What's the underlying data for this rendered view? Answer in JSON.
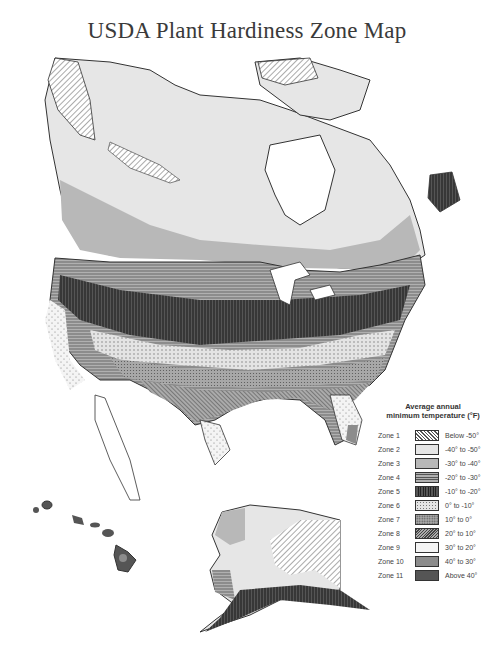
{
  "title": "USDA Plant Hardiness Zone Map",
  "legend": {
    "title_line1": "Average annual",
    "title_line2": "minimum temperature (°F)",
    "zones": [
      {
        "label": "Zone 1",
        "range": "Below -50°",
        "pattern": "diag-hatch",
        "color": "#ffffff"
      },
      {
        "label": "Zone 2",
        "range": "-40° to -50°",
        "pattern": "solid",
        "color": "#e6e6e6"
      },
      {
        "label": "Zone 3",
        "range": "-30° to -40°",
        "pattern": "solid",
        "color": "#b8b8b8"
      },
      {
        "label": "Zone 4",
        "range": "-20° to -30°",
        "pattern": "horizontal-lines",
        "color": "#a8a8a8"
      },
      {
        "label": "Zone 5",
        "range": "-10° to -20°",
        "pattern": "vertical-lines",
        "color": "#3c3c3c"
      },
      {
        "label": "Zone 6",
        "range": "0° to -10°",
        "pattern": "dots-light",
        "color": "#dcdcdc"
      },
      {
        "label": "Zone 7",
        "range": "10° to 0°",
        "pattern": "dense-dots",
        "color": "#a0a0a0"
      },
      {
        "label": "Zone 8",
        "range": "20° to 10°",
        "pattern": "diag-dense",
        "color": "#888888"
      },
      {
        "label": "Zone 9",
        "range": "30° to 20°",
        "pattern": "stipple",
        "color": "#f2f2f2"
      },
      {
        "label": "Zone 10",
        "range": "40° to 30°",
        "pattern": "solid",
        "color": "#8c8c8c"
      },
      {
        "label": "Zone 11",
        "range": "Above 40°",
        "pattern": "solid",
        "color": "#555555"
      }
    ]
  },
  "regions": [
    "Canada",
    "Contiguous United States",
    "Mexico (partial)",
    "Alaska",
    "Hawaii"
  ]
}
